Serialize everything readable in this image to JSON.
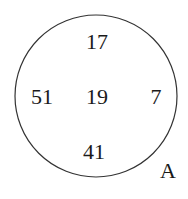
{
  "diagram": {
    "type": "venn-set",
    "set_label": "A",
    "elements": [
      {
        "value": "17",
        "position": "top"
      },
      {
        "value": "51",
        "position": "left"
      },
      {
        "value": "19",
        "position": "center"
      },
      {
        "value": "7",
        "position": "right"
      },
      {
        "value": "41",
        "position": "bottom"
      }
    ],
    "colors": {
      "stroke": "#333333",
      "text": "#1a1a1a",
      "background": "#ffffff"
    }
  }
}
